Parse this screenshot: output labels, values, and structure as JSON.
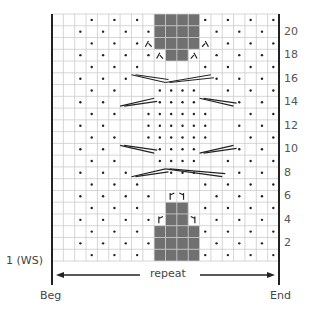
{
  "chart_data": {
    "type": "knitting-chart",
    "columns": 20,
    "rows": 21,
    "first_row_label": "1 (WS)",
    "row_numbers_right": [
      2,
      4,
      6,
      8,
      10,
      12,
      14,
      16,
      18,
      20
    ],
    "repeat_label": "repeat",
    "beg_label": "Beg",
    "end_label": "End",
    "colors": {
      "grid": "#cccccc",
      "dark": "#707070",
      "border": "#222222",
      "dot": "#222222",
      "text": "#555555"
    },
    "dots": {
      "1": [
        3,
        5,
        7,
        13,
        15,
        17,
        19
      ],
      "2": [
        2,
        4,
        6,
        8,
        14,
        16,
        18
      ],
      "3": [
        3,
        5,
        7,
        13,
        15,
        17,
        19
      ],
      "4": [
        2,
        4,
        6,
        8,
        14,
        16,
        18
      ],
      "5": [
        3,
        5,
        7,
        13,
        15,
        17,
        19
      ],
      "6": [
        2,
        4,
        6,
        8,
        14,
        16,
        18
      ],
      "7": [
        3,
        5,
        7,
        13,
        15,
        17,
        19
      ],
      "8": [
        2,
        4,
        6,
        10,
        11,
        12,
        16,
        18
      ],
      "9": [
        3,
        5,
        9,
        10,
        11,
        12,
        15,
        17,
        19
      ],
      "10": [
        2,
        4,
        9,
        10,
        11,
        12,
        16,
        18
      ],
      "11": [
        3,
        5,
        8,
        9,
        10,
        11,
        12,
        13,
        17,
        19
      ],
      "12": [
        2,
        4,
        8,
        9,
        10,
        11,
        12,
        13,
        16,
        18
      ],
      "13": [
        3,
        5,
        8,
        9,
        10,
        11,
        12,
        13,
        17,
        19
      ],
      "14": [
        2,
        4,
        9,
        10,
        11,
        12,
        16,
        18
      ],
      "15": [
        3,
        5,
        9,
        10,
        11,
        12,
        15,
        17,
        19
      ],
      "16": [
        2,
        4,
        6,
        14,
        16,
        18
      ],
      "17": [
        3,
        5,
        7,
        13,
        15,
        17,
        19
      ],
      "18": [
        2,
        4,
        6,
        8,
        14,
        16,
        18
      ],
      "19": [
        3,
        5,
        7,
        15,
        17,
        19
      ],
      "20": [
        2,
        4,
        6,
        8,
        14,
        16,
        18
      ],
      "21": [
        3,
        5,
        7,
        13,
        15,
        17,
        19
      ]
    },
    "dark_cells": {
      "1": [
        9,
        10,
        11,
        12
      ],
      "2": [
        9,
        10,
        11,
        12
      ],
      "3": [
        9,
        10,
        11,
        12
      ],
      "4": [
        10,
        11
      ],
      "5": [
        10,
        11
      ],
      "18": [
        10,
        11
      ],
      "19": [
        9,
        10,
        11,
        12
      ],
      "20": [
        9,
        10,
        11,
        12
      ],
      "21": [
        9,
        10,
        11,
        12
      ]
    },
    "symbols": [
      {
        "row": 4,
        "col": 9,
        "type": "increase-left"
      },
      {
        "row": 4,
        "col": 12,
        "type": "increase-right"
      },
      {
        "row": 6,
        "col": 10,
        "type": "increase-left"
      },
      {
        "row": 6,
        "col": 11,
        "type": "increase-right"
      },
      {
        "row": 18,
        "col": 9,
        "type": "decrease-left"
      },
      {
        "row": 18,
        "col": 12,
        "type": "decrease-right"
      },
      {
        "row": 19,
        "col": 8,
        "type": "decrease-left"
      },
      {
        "row": 19,
        "col": 13,
        "type": "decrease-right"
      }
    ],
    "cables": [
      {
        "row": 8,
        "from": 7,
        "to": 10,
        "dir": "up"
      },
      {
        "row": 8,
        "from": 10,
        "to": 15,
        "dir": "down"
      },
      {
        "row": 10,
        "from": 6,
        "to": 9,
        "dir": "down"
      },
      {
        "row": 10,
        "from": 13,
        "to": 16,
        "dir": "up"
      },
      {
        "row": 14,
        "from": 6,
        "to": 9,
        "dir": "up"
      },
      {
        "row": 14,
        "from": 13,
        "to": 16,
        "dir": "down"
      },
      {
        "row": 16,
        "from": 7,
        "to": 10,
        "dir": "down"
      },
      {
        "row": 16,
        "from": 10,
        "to": 14,
        "dir": "up"
      }
    ]
  }
}
